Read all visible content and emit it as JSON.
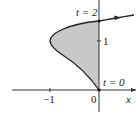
{
  "diagram": {
    "type": "parametric-curve",
    "labels": {
      "t_top": "t = 2",
      "t_bottom": "t = 0",
      "y_tick": "1",
      "x_tick_neg": "−1",
      "x_origin": "0",
      "x_axis": "x"
    },
    "colors": {
      "fill": "#c8c8c8",
      "curve": "#222222",
      "axis": "#333333"
    }
  }
}
